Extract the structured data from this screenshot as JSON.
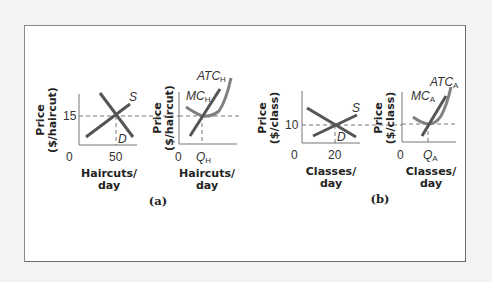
{
  "figure": {
    "panels": [
      {
        "label": "(a)",
        "market": {
          "y_title_line1": "Price",
          "y_title_line2": "($/haircut)",
          "x_title_line1": "Haircuts/",
          "x_title_line2": "day",
          "origin": "0",
          "price_tick": "15",
          "quantity_tick": "50",
          "supply_label": "S",
          "demand_label": "D"
        },
        "firm": {
          "y_title_line1": "Price",
          "y_title_line2": "($/haircut)",
          "x_title_line1": "Haircuts/",
          "x_title_line2": "day",
          "origin": "0",
          "quantity_tick": "Q",
          "quantity_tick_sub": "H",
          "mc_label": "MC",
          "mc_sub": "H",
          "atc_label": "ATC",
          "atc_sub": "H"
        }
      },
      {
        "label": "(b)",
        "market": {
          "y_title_line1": "Price",
          "y_title_line2": "($/class)",
          "x_title_line1": "Classes/",
          "x_title_line2": "day",
          "origin": "0",
          "price_tick": "10",
          "quantity_tick": "20",
          "supply_label": "S",
          "demand_label": "D"
        },
        "firm": {
          "y_title_line1": "Price",
          "y_title_line2": "($/class)",
          "x_title_line1": "Classes/",
          "x_title_line2": "day",
          "origin": "0",
          "quantity_tick": "Q",
          "quantity_tick_sub": "A",
          "mc_label": "MC",
          "mc_sub": "A",
          "atc_label": "ATC",
          "atc_sub": "A"
        }
      }
    ]
  },
  "colors": {
    "curve": "#555555",
    "axis": "#777777",
    "frame": "#6a6a6a",
    "background": "#f3f3f3"
  }
}
